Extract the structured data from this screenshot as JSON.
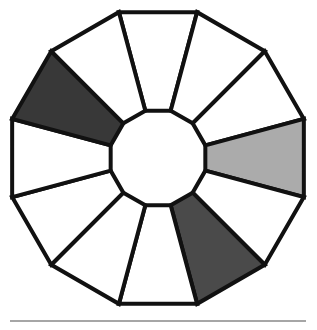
{
  "figure": {
    "background_color": "#ffffff",
    "outline_color": "#111111",
    "outline_width": 4,
    "geometry": {
      "center_x": 158,
      "center_y": 158,
      "inner_radius": 49,
      "outer_radius": 151,
      "segment_count": 12,
      "start_angle_deg": -105
    },
    "palette": {
      "empty": "#ffffff",
      "light_gray": "#ababab",
      "medium_gray": "#4a4a4a",
      "dark_gray": "#383838"
    },
    "segments": [
      {
        "index": 0,
        "position": "top-center-left",
        "fill": "#ffffff",
        "shade": "empty"
      },
      {
        "index": 1,
        "position": "top-center-right",
        "fill": "#ffffff",
        "shade": "empty"
      },
      {
        "index": 2,
        "position": "upper-right",
        "fill": "#ffffff",
        "shade": "empty"
      },
      {
        "index": 3,
        "position": "right-upper",
        "fill": "#ababab",
        "shade": "light_gray"
      },
      {
        "index": 4,
        "position": "right-center",
        "fill": "#ffffff",
        "shade": "empty"
      },
      {
        "index": 5,
        "position": "right-lower",
        "fill": "#4a4a4a",
        "shade": "medium_gray"
      },
      {
        "index": 6,
        "position": "lower-right",
        "fill": "#ffffff",
        "shade": "empty"
      },
      {
        "index": 7,
        "position": "bottom-right",
        "fill": "#ffffff",
        "shade": "empty"
      },
      {
        "index": 8,
        "position": "bottom-left",
        "fill": "#ffffff",
        "shade": "empty"
      },
      {
        "index": 9,
        "position": "lower-left",
        "fill": "#ffffff",
        "shade": "empty"
      },
      {
        "index": 10,
        "position": "left-center",
        "fill": "#383838",
        "shade": "dark_gray"
      },
      {
        "index": 11,
        "position": "upper-left",
        "fill": "#ffffff",
        "shade": "empty"
      }
    ]
  },
  "footer_rule": {
    "x": 10,
    "y": 320,
    "width": 296,
    "color": "#a6a6a6"
  }
}
